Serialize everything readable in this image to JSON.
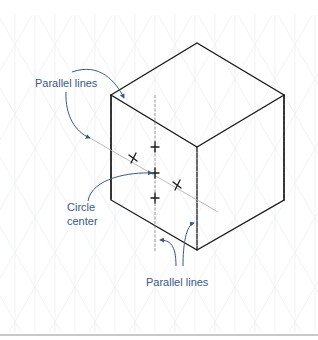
{
  "figure": {
    "type": "isometric cube construction sketch",
    "colors": {
      "ink": "#1a1a1a",
      "annotation": "#3b5a86",
      "grid": "#e8ecef",
      "rule": "#c8c8c8"
    },
    "labels": {
      "top_parallel": "Parallel lines",
      "circle_center_line1": "Circle",
      "circle_center_line2": "center",
      "bottom_parallel": "Parallel lines"
    },
    "cube": {
      "top": [
        197,
        43
      ],
      "left": [
        111,
        95
      ],
      "right": [
        284,
        95
      ],
      "front_top": [
        197,
        147
      ],
      "bottom_left": [
        111,
        200
      ],
      "bottom_front": [
        197,
        250
      ],
      "bottom_right": [
        284,
        200
      ]
    },
    "marks": {
      "vertical_guide": [
        [
          155,
          95
        ],
        [
          155,
          252
        ]
      ],
      "diagonal_guide": [
        [
          90,
          138
        ],
        [
          218,
          212
        ]
      ],
      "crosses": [
        [
          155,
          147
        ],
        [
          133,
          158
        ],
        [
          155,
          173
        ],
        [
          177,
          185
        ],
        [
          155,
          198
        ]
      ]
    }
  }
}
